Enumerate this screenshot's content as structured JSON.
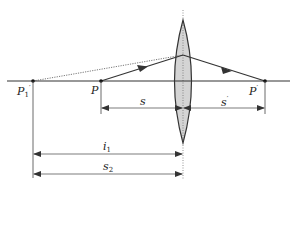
{
  "diagram": {
    "type": "thin-lens-ray-diagram",
    "colors": {
      "line": "#333333",
      "lens_fill": "#d4d4d4",
      "lens_stroke": "#333333",
      "dotted": "#555555",
      "background": "#ffffff"
    },
    "points": {
      "P1_prime": {
        "label": "P",
        "sub": "1",
        "sup": "′"
      },
      "P": {
        "label": "P"
      },
      "P_prime": {
        "label": "P",
        "sup": "′"
      }
    },
    "dimensions": {
      "s": {
        "label": "s"
      },
      "s_prime": {
        "label": "s",
        "sup": "′"
      },
      "i1": {
        "label": "i",
        "sub": "1"
      },
      "s2": {
        "label": "s",
        "sub": "2"
      }
    },
    "elements": {
      "lens": "converging (biconvex) lens",
      "optical_axis": "horizontal principal axis",
      "incident_ray": "ray from P to lens with arrow",
      "refracted_ray": "ray from lens to P′ with arrow",
      "virtual_extension": "dotted line from P1′ to lens"
    }
  }
}
